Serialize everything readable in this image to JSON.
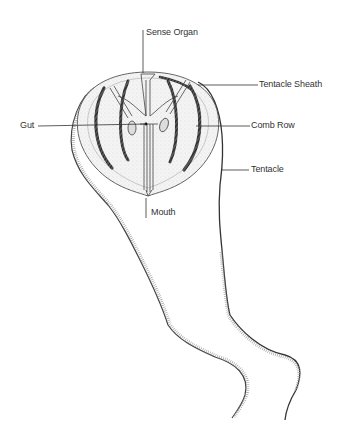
{
  "diagram": {
    "style": "pen-and-ink illustration",
    "colors": {
      "ink": "#2a2a2a",
      "body_fill": "#eeeeee",
      "label_text": "#333333",
      "background": "#ffffff"
    },
    "labels": {
      "sense_organ": "Sense Organ",
      "tentacle_sheath": "Tentacle Sheath",
      "gut": "Gut",
      "comb_row": "Comb Row",
      "tentacle": "Tentacle",
      "mouth": "Mouth"
    }
  }
}
